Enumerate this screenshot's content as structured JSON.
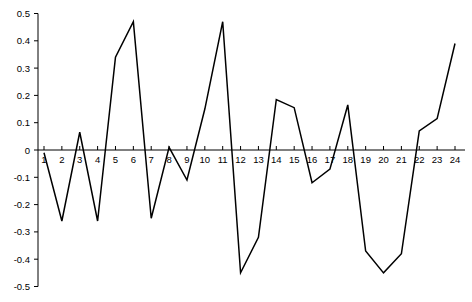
{
  "chart_data": {
    "type": "line",
    "title": "",
    "subtitle": "",
    "xlabel": "",
    "ylabel": "",
    "x": [
      1,
      2,
      3,
      4,
      5,
      6,
      7,
      8,
      9,
      10,
      11,
      12,
      13,
      14,
      15,
      16,
      17,
      18,
      19,
      20,
      21,
      22,
      23,
      24
    ],
    "values": [
      -0.01,
      -0.26,
      0.065,
      -0.26,
      0.34,
      0.47,
      -0.25,
      0.01,
      -0.11,
      0.15,
      0.47,
      -0.45,
      -0.32,
      0.185,
      0.155,
      -0.12,
      -0.07,
      0.165,
      -0.37,
      -0.45,
      -0.38,
      0.07,
      0.115,
      0.39
    ],
    "series": [
      {
        "name": "series-1",
        "color": "#000000",
        "values": [
          -0.01,
          -0.26,
          0.065,
          -0.26,
          0.34,
          0.47,
          -0.25,
          0.01,
          -0.11,
          0.15,
          0.47,
          -0.45,
          -0.32,
          0.185,
          0.155,
          -0.12,
          -0.07,
          0.165,
          -0.37,
          -0.45,
          -0.38,
          0.07,
          0.115,
          0.39
        ]
      }
    ],
    "xlim": [
      1,
      24
    ],
    "ylim": [
      -0.5,
      0.5
    ],
    "xticks": [
      1,
      2,
      3,
      4,
      5,
      6,
      7,
      8,
      9,
      10,
      11,
      12,
      13,
      14,
      15,
      16,
      17,
      18,
      19,
      20,
      21,
      22,
      23,
      24
    ],
    "xtick_labels": [
      "1",
      "2",
      "3",
      "4",
      "5",
      "6",
      "7",
      "8",
      "9",
      "10",
      "11",
      "12",
      "13",
      "14",
      "15",
      "16",
      "17",
      "18",
      "19",
      "20",
      "21",
      "22",
      "23",
      "24"
    ],
    "yticks": [
      -0.5,
      -0.4,
      -0.3,
      -0.2,
      -0.1,
      0,
      0.1,
      0.2,
      0.3,
      0.4,
      0.5
    ],
    "ytick_labels": [
      "-0.5",
      "-0.4",
      "-0.3",
      "-0.2",
      "-0.1",
      "0",
      "0.1",
      "0.2",
      "0.3",
      "0.4",
      "0.5"
    ],
    "grid": false,
    "legend": false,
    "legend_position": "none",
    "background_color": "#ffffff",
    "line_color": "#000000",
    "axis_color": "#000000"
  }
}
